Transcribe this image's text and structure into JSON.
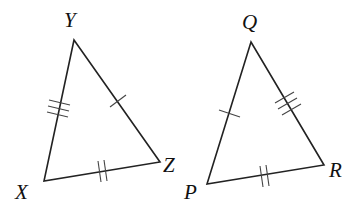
{
  "diagram": {
    "type": "congruent-triangles",
    "triangles": [
      {
        "name": "XYZ",
        "vertices": {
          "X": {
            "label": "X",
            "x": 44,
            "y": 181
          },
          "Y": {
            "label": "Y",
            "x": 74,
            "y": 40
          },
          "Z": {
            "label": "Z",
            "x": 160,
            "y": 162
          }
        },
        "sides": [
          {
            "side": "XY",
            "tick_marks": 3
          },
          {
            "side": "YZ",
            "tick_marks": 1
          },
          {
            "side": "XZ",
            "tick_marks": 2
          }
        ]
      },
      {
        "name": "PQR",
        "vertices": {
          "P": {
            "label": "P",
            "x": 207,
            "y": 184
          },
          "Q": {
            "label": "Q",
            "x": 251,
            "y": 42
          },
          "R": {
            "label": "R",
            "x": 324,
            "y": 165
          }
        },
        "sides": [
          {
            "side": "PQ",
            "tick_marks": 1
          },
          {
            "side": "QR",
            "tick_marks": 3
          },
          {
            "side": "PR",
            "tick_marks": 2
          }
        ]
      }
    ],
    "labels": {
      "X": "X",
      "Y": "Y",
      "Z": "Z",
      "P": "P",
      "Q": "Q",
      "R": "R"
    },
    "colors": {
      "line": "#222222",
      "background": "#ffffff"
    }
  }
}
